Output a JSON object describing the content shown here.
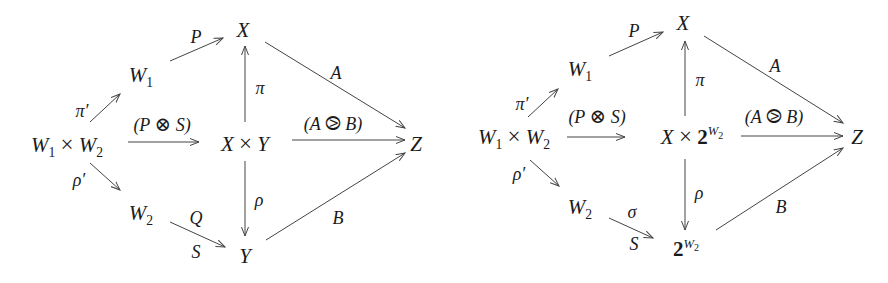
{
  "diagrams": [
    {
      "name": "left",
      "nodes": {
        "X": "X",
        "W1": "W",
        "W1_sub": "1",
        "W1xW2_a": "W",
        "W1xW2_a_sub": "1",
        "W1xW2_times": "×",
        "W1xW2_b": "W",
        "W1xW2_b_sub": "2",
        "center_a": "X",
        "center_times": "×",
        "center_b": "Y",
        "Z": "Z",
        "W2": "W",
        "W2_sub": "2",
        "bottom": "Y"
      },
      "labels": {
        "P": "P",
        "A": "A",
        "pi": "π",
        "pi_prime": "π′",
        "rho": "ρ",
        "rho_prime": "ρ′",
        "PS_open": "(P ",
        "PS_op": "⊗",
        "PS_close": " S)",
        "AB_open": "(A ",
        "AB_op": "⧁",
        "AB_close": " B)",
        "B": "B",
        "Q": "Q",
        "S": "S"
      }
    },
    {
      "name": "right",
      "nodes": {
        "X": "X",
        "W1": "W",
        "W1_sub": "1",
        "W1xW2_a": "W",
        "W1xW2_a_sub": "1",
        "W1xW2_times": "×",
        "W1xW2_b": "W",
        "W1xW2_b_sub": "2",
        "center_a": "X",
        "center_times": "×",
        "center_base": "2",
        "center_exp": "W",
        "center_exp_sub": "2",
        "Z": "Z",
        "W2": "W",
        "W2_sub": "2",
        "bottom_base": "2",
        "bottom_exp": "W",
        "bottom_exp_sub": "2"
      },
      "labels": {
        "P": "P",
        "A": "A",
        "pi": "π",
        "pi_prime": "π′",
        "rho": "ρ",
        "rho_prime": "ρ′",
        "PS_open": "(P ",
        "PS_op": "⊗",
        "PS_close": " S)",
        "AB_open": "(A ",
        "AB_op": "⧁",
        "AB_close": " B)",
        "B": "B",
        "sigma": "σ",
        "S": "S"
      }
    }
  ],
  "colors": {
    "ink": "#1a1a1a",
    "arrow": "#444444",
    "background": "#ffffff"
  }
}
